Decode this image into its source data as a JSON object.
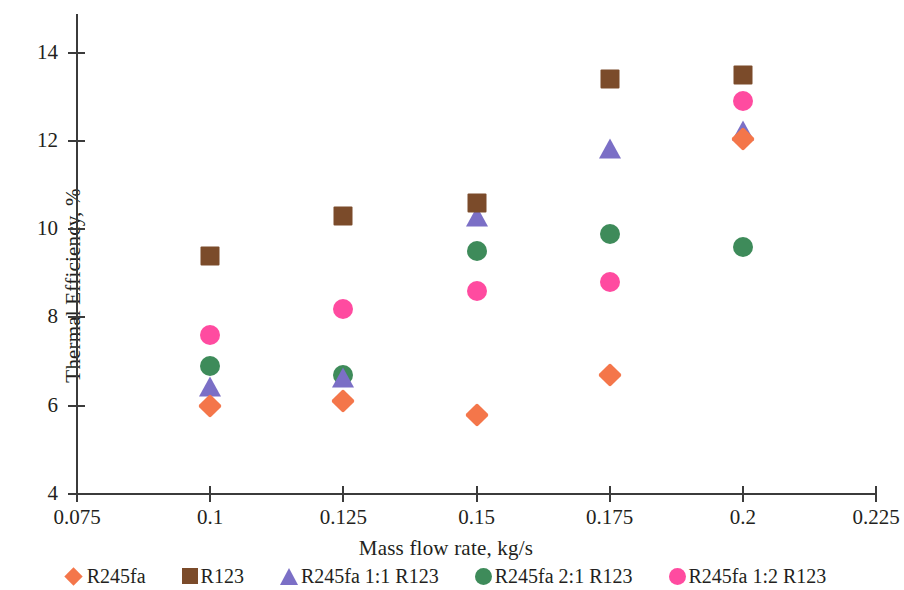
{
  "chart_data": {
    "type": "scatter",
    "title": "",
    "xlabel": "Mass flow rate, kg/s",
    "ylabel": "Thermal Efficiency, %",
    "xlim": [
      0.075,
      0.225
    ],
    "ylim": [
      4,
      14.8
    ],
    "xticks": [
      "0.075",
      "0.1",
      "0.125",
      "0.15",
      "0.175",
      "0.2",
      "0.225"
    ],
    "xtick_values": [
      0.075,
      0.1,
      0.125,
      0.15,
      0.175,
      0.2,
      0.225
    ],
    "yticks": [
      "4",
      "6",
      "8",
      "10",
      "12",
      "14"
    ],
    "ytick_values": [
      4,
      6,
      8,
      10,
      12,
      14
    ],
    "grid": false,
    "legend_position": "bottom",
    "x": [
      0.1,
      0.125,
      0.15,
      0.175,
      0.2
    ],
    "series": [
      {
        "name": "R245fa",
        "marker": "diamond",
        "color": "#F4764A",
        "values": [
          6.0,
          6.1,
          5.8,
          6.7,
          12.05
        ]
      },
      {
        "name": "R123",
        "marker": "square",
        "color": "#7B4B2A",
        "values": [
          9.4,
          10.3,
          10.6,
          13.4,
          13.5
        ]
      },
      {
        "name": "R245fa 1:1 R123",
        "marker": "triangle",
        "color": "#7B6FC6",
        "values": [
          6.4,
          6.6,
          10.25,
          11.8,
          12.2
        ]
      },
      {
        "name": "R245fa 2:1 R123",
        "marker": "circle",
        "color": "#3E8B5A",
        "values": [
          6.9,
          6.7,
          9.5,
          9.9,
          9.6
        ]
      },
      {
        "name": "R245fa 1:2 R123",
        "marker": "circle",
        "color": "#FF4BA0",
        "values": [
          7.6,
          8.2,
          8.6,
          8.8,
          12.9
        ]
      }
    ]
  }
}
